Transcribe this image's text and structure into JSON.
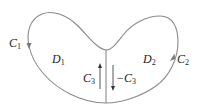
{
  "diagram": {
    "type": "region-decomposition",
    "colors": {
      "stroke": "#8a8a8a",
      "text": "#222222",
      "background": "#ffffff"
    },
    "regions": [
      {
        "id": "D1",
        "label": "D",
        "sub": "1"
      },
      {
        "id": "D2",
        "label": "D",
        "sub": "2"
      }
    ],
    "curves": [
      {
        "id": "C1",
        "label": "C",
        "sub": "1",
        "arrow": "down"
      },
      {
        "id": "C2",
        "label": "C",
        "sub": "2",
        "arrow": "up"
      },
      {
        "id": "C3",
        "label": "C",
        "sub": "3",
        "arrow": "up"
      },
      {
        "id": "negC3",
        "label": "−C",
        "sub": "3",
        "arrow": "down"
      }
    ]
  }
}
